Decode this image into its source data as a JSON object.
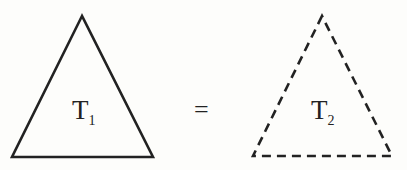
{
  "diagram": {
    "left_triangle": {
      "label": "T",
      "subscript": "1",
      "style": "solid"
    },
    "relation": "=",
    "right_triangle": {
      "label": "T",
      "subscript": "2",
      "style": "dashed"
    },
    "stroke_color": "#222222",
    "background": "#fdfdfb"
  }
}
